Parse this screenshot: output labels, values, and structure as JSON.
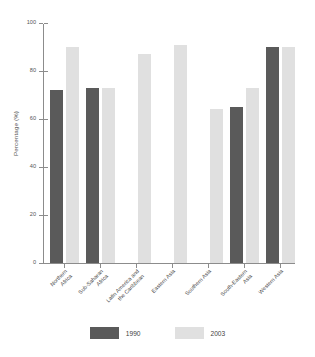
{
  "chart_data": {
    "type": "bar",
    "title": "",
    "xlabel": "",
    "ylabel": "Percentage (%)",
    "ylim": [
      0,
      100
    ],
    "yticks": [
      0,
      20,
      40,
      60,
      80,
      100
    ],
    "ytick_labels": [
      "0",
      "20",
      "40",
      "60",
      "80",
      "100"
    ],
    "grid": false,
    "legend_position": "bottom",
    "categories": [
      "Northern Africa",
      "Sub-Saharan Africa",
      "Latin America and the Caribbean",
      "Eastern Asia",
      "Southern Asia",
      "South-Eastern Asia",
      "Western Asia"
    ],
    "category_lines": [
      [
        "Northern",
        "Africa"
      ],
      [
        "Sub-Saharan",
        "Africa"
      ],
      [
        "Latin America and",
        "the Caribbean"
      ],
      [
        "Eastern Asia"
      ],
      [
        "Southern Asia"
      ],
      [
        "South-Eastern",
        "Asia"
      ],
      [
        "Western Asia"
      ]
    ],
    "series": [
      {
        "name": "1990",
        "color": "#5a5a5a",
        "values": [
          72,
          73,
          null,
          null,
          null,
          65,
          90
        ]
      },
      {
        "name": "2003",
        "color": "#e0e0e0",
        "values": [
          90,
          73,
          87,
          91,
          64,
          73,
          90
        ]
      }
    ]
  },
  "legend": {
    "entries": [
      {
        "label": "1990",
        "color": "#5a5a5a"
      },
      {
        "label": "2003",
        "color": "#e0e0e0"
      }
    ]
  },
  "axis": {
    "y_title": "Percentage (%)"
  }
}
